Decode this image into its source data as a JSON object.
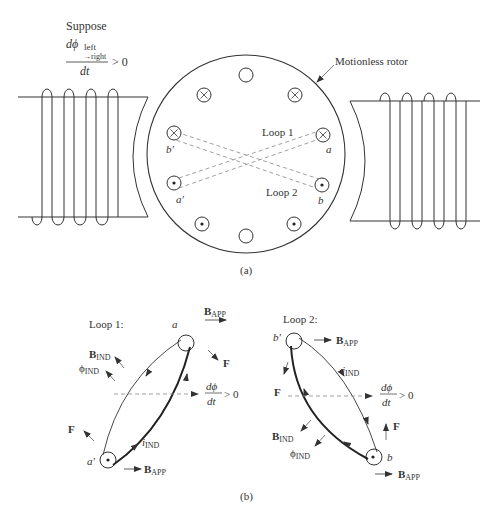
{
  "figure": {
    "part_a": {
      "caption": "(a)",
      "condition": {
        "prefix": "Suppose",
        "numerator": "dϕ",
        "subscript_top": "left",
        "subscript_bottom": "→right",
        "denominator": "dt",
        "relation": "> 0"
      },
      "rotor_label": "Motionless rotor",
      "loop1_label": "Loop 1",
      "loop2_label": "Loop 2",
      "terminals": {
        "a": "a",
        "b": "b",
        "a_prime": "a′",
        "b_prime": "b′"
      },
      "slots": [
        {
          "id": "top",
          "symbol": "empty"
        },
        {
          "id": "upper-left",
          "symbol": "cross"
        },
        {
          "id": "upper-right",
          "symbol": "cross"
        },
        {
          "id": "b-prime",
          "symbol": "cross"
        },
        {
          "id": "a",
          "symbol": "cross"
        },
        {
          "id": "a-prime",
          "symbol": "dot"
        },
        {
          "id": "b",
          "symbol": "dot"
        },
        {
          "id": "lower-left",
          "symbol": "dot"
        },
        {
          "id": "lower-right",
          "symbol": "dot"
        },
        {
          "id": "bottom",
          "symbol": "empty"
        }
      ]
    },
    "part_b": {
      "caption": "(b)",
      "loop1": {
        "title": "Loop 1:",
        "top_terminal": "a",
        "bottom_terminal": "a′",
        "b_app": "B",
        "b_app_sub": "APP",
        "b_ind": "B",
        "b_ind_sub": "IND",
        "phi_ind": "ϕ",
        "phi_ind_sub": "IND",
        "force": "F",
        "current": "i",
        "current_sub": "IND",
        "dphi_num": "dϕ",
        "dphi_den": "dt",
        "dphi_rel": "> 0"
      },
      "loop2": {
        "title": "Loop 2:",
        "top_terminal": "b′",
        "bottom_terminal": "b",
        "b_app": "B",
        "b_app_sub": "APP",
        "b_ind": "B",
        "b_ind_sub": "IND",
        "phi_ind": "ϕ",
        "phi_ind_sub": "IND",
        "force": "F",
        "current": "i",
        "current_sub": "IND",
        "dphi_num": "dϕ",
        "dphi_den": "dt",
        "dphi_rel": "> 0"
      }
    }
  }
}
